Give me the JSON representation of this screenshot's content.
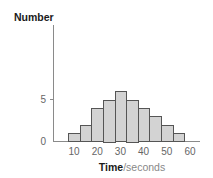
{
  "chart_data": {
    "type": "bar",
    "subtype": "histogram",
    "title": "",
    "ylabel": "Number",
    "xlabel_bold": "Time",
    "xlabel_rest": "/seconds",
    "xlabel": "Time/seconds",
    "categories": [
      10,
      15,
      20,
      25,
      30,
      35,
      40,
      45,
      50,
      55
    ],
    "bin_width": 5,
    "values": [
      1,
      2,
      4,
      5,
      6,
      5,
      4,
      3,
      2,
      1
    ],
    "ylim": [
      0,
      13
    ],
    "xlim": [
      0,
      60
    ],
    "yticks": [
      0,
      5
    ],
    "xticks": [
      10,
      20,
      30,
      40,
      50,
      60
    ],
    "grid": false,
    "legend": null,
    "colors": {
      "bar_fill": "#d3d3d3",
      "bar_edge": "#555555",
      "axis": "#8a8a8a"
    }
  }
}
